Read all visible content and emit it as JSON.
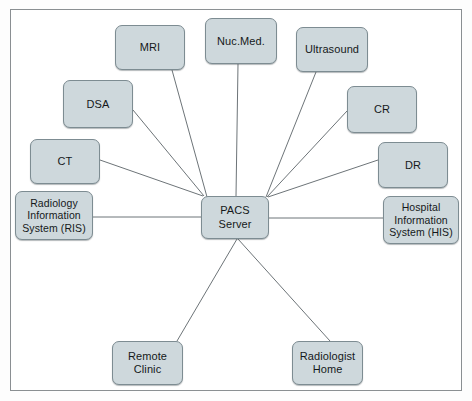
{
  "diagram": {
    "type": "hub-and-spoke-diagram",
    "colors": {
      "node_fill": "#ced8dc",
      "node_border": "#7d8c92",
      "edge_stroke": "#6d7478",
      "frame_border": "#8a8f92",
      "background": "#ffffff",
      "text": "#15181a"
    },
    "frame": {
      "x": 10,
      "y": 9,
      "width": 452,
      "height": 382
    },
    "hub": {
      "id": "pacs-server",
      "label": "PACS\nServer",
      "x": 201,
      "y": 196,
      "width": 68,
      "height": 43
    },
    "nodes": [
      {
        "id": "mri",
        "label": "MRI",
        "x": 115,
        "y": 25,
        "width": 70,
        "height": 45,
        "multiline": false
      },
      {
        "id": "nuc-med",
        "label": "Nuc.Med.",
        "x": 205,
        "y": 18,
        "width": 72,
        "height": 46,
        "multiline": false
      },
      {
        "id": "ultrasound",
        "label": "Ultrasound",
        "x": 296,
        "y": 27,
        "width": 72,
        "height": 45,
        "multiline": false
      },
      {
        "id": "dsa",
        "label": "DSA",
        "x": 63,
        "y": 80,
        "width": 70,
        "height": 48,
        "multiline": false
      },
      {
        "id": "cr",
        "label": "CR",
        "x": 347,
        "y": 86,
        "width": 70,
        "height": 47,
        "multiline": false
      },
      {
        "id": "ct",
        "label": "CT",
        "x": 30,
        "y": 139,
        "width": 70,
        "height": 45,
        "multiline": false
      },
      {
        "id": "dr",
        "label": "DR",
        "x": 378,
        "y": 142,
        "width": 70,
        "height": 46,
        "multiline": false
      },
      {
        "id": "ris",
        "label": "Radiology\nInformation\nSystem (RIS)",
        "x": 15,
        "y": 191,
        "width": 78,
        "height": 49,
        "multiline": true
      },
      {
        "id": "his",
        "label": "Hospital\nInformation\nSystem (HIS)",
        "x": 383,
        "y": 196,
        "width": 76,
        "height": 48,
        "multiline": true
      },
      {
        "id": "remote-clinic",
        "label": "Remote\nClinic",
        "x": 112,
        "y": 341,
        "width": 71,
        "height": 44,
        "multiline": false
      },
      {
        "id": "radiologist-home",
        "label": "Radiologist\nHome",
        "x": 292,
        "y": 341,
        "width": 71,
        "height": 44,
        "multiline": false
      }
    ],
    "edges": [
      {
        "id": "edge-mri-pacs",
        "from": "mri",
        "to": "pacs-server",
        "x1": 172,
        "y1": 70,
        "x2": 207,
        "y2": 197
      },
      {
        "id": "edge-nucmed-pacs",
        "from": "nuc-med",
        "to": "pacs-server",
        "x1": 238,
        "y1": 64,
        "x2": 236,
        "y2": 196
      },
      {
        "id": "edge-ultrasound-pacs",
        "from": "ultrasound",
        "to": "pacs-server",
        "x1": 316,
        "y1": 72,
        "x2": 266,
        "y2": 197
      },
      {
        "id": "edge-dsa-pacs",
        "from": "dsa",
        "to": "pacs-server",
        "x1": 133,
        "y1": 110,
        "x2": 204,
        "y2": 196
      },
      {
        "id": "edge-cr-pacs",
        "from": "cr",
        "to": "pacs-server",
        "x1": 347,
        "y1": 111,
        "x2": 267,
        "y2": 197
      },
      {
        "id": "edge-ct-pacs",
        "from": "ct",
        "to": "pacs-server",
        "x1": 100,
        "y1": 160,
        "x2": 203,
        "y2": 196
      },
      {
        "id": "edge-dr-pacs",
        "from": "dr",
        "to": "pacs-server",
        "x1": 378,
        "y1": 160,
        "x2": 268,
        "y2": 197
      },
      {
        "id": "edge-ris-pacs",
        "from": "ris",
        "to": "pacs-server",
        "x1": 93,
        "y1": 217,
        "x2": 201,
        "y2": 217
      },
      {
        "id": "edge-his-pacs",
        "from": "his",
        "to": "pacs-server",
        "x1": 383,
        "y1": 218,
        "x2": 269,
        "y2": 218
      },
      {
        "id": "edge-pacs-remote-clinic",
        "from": "pacs-server",
        "to": "remote-clinic",
        "x1": 237,
        "y1": 239,
        "x2": 177,
        "y2": 341
      },
      {
        "id": "edge-pacs-radiologist-home",
        "from": "pacs-server",
        "to": "radiologist-home",
        "x1": 238,
        "y1": 239,
        "x2": 330,
        "y2": 341
      }
    ]
  }
}
